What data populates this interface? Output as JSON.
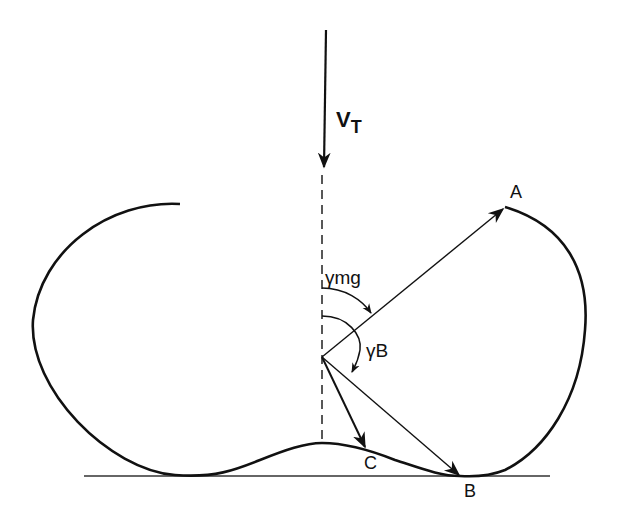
{
  "diagram": {
    "colors": {
      "ink": "#111111",
      "background": "#ffffff"
    },
    "labels": {
      "velocity": "V",
      "velocity_sub": "T",
      "gamma_mg": "γ",
      "gamma_mg_sub": "mg",
      "gamma_b": "γ",
      "gamma_b_sub": "B",
      "point_a": "A",
      "point_b": "B",
      "point_c": "C"
    }
  }
}
